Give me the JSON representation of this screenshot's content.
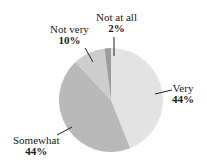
{
  "chart_data": {
    "type": "pie",
    "title": "",
    "start_angle_deg": 0,
    "direction": "clockwise",
    "slices": [
      {
        "label": "Very",
        "value": 44,
        "display": "44%",
        "color": "#e3e3e3"
      },
      {
        "label": "Somewhat",
        "value": 44,
        "display": "44%",
        "color": "#b9b9b9"
      },
      {
        "label": "Not very",
        "value": 10,
        "display": "10%",
        "color": "#cdcdcd"
      },
      {
        "label": "Not at all",
        "value": 2,
        "display": "2%",
        "color": "#9c9c9c"
      }
    ],
    "legend": "none",
    "labels_position": "outside with leader lines"
  },
  "labels": {
    "very": {
      "name": "Very",
      "pct": "44%"
    },
    "somewhat": {
      "name": "Somewhat",
      "pct": "44%"
    },
    "not_very": {
      "name": "Not very",
      "pct": "10%"
    },
    "not_at_all": {
      "name": "Not at all",
      "pct": "2%"
    }
  }
}
